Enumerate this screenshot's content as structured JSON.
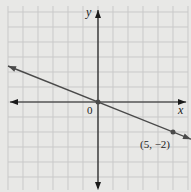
{
  "chart_data": {
    "type": "line",
    "title": "",
    "xlabel": "x",
    "ylabel": "y",
    "xlim": [
      -6,
      6
    ],
    "ylim": [
      -6,
      6
    ],
    "grid": true,
    "origin_label": "0",
    "series": [
      {
        "name": "line",
        "slope": -0.4,
        "intercept": 0,
        "x": [
          -6,
          6
        ],
        "y": [
          2.4,
          -2.4
        ]
      }
    ],
    "points": [
      {
        "x": 0,
        "y": 0,
        "label": ""
      },
      {
        "x": 5,
        "y": -2,
        "label": "(5, −2)"
      }
    ],
    "colors": {
      "background": "#e8e8e6",
      "grid": "#c9c9c9",
      "axis": "#1a1a1a",
      "line": "#4a4a4a",
      "point": "#4a4a4a"
    }
  }
}
